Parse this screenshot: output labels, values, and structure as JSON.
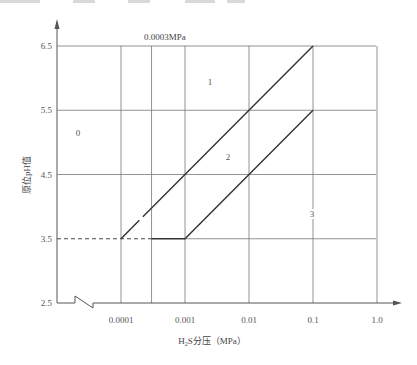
{
  "chart_data": {
    "type": "line",
    "title": "",
    "xlabel": "H2S分压（MPa）",
    "xlabel_parts": {
      "pre": "H",
      "sub": "2",
      "post": "S分压（MPa）"
    },
    "ylabel": "原位pH值",
    "x_scale": "log",
    "x_ticks": [
      "0.0001",
      "0.001",
      "0.01",
      "0.1",
      "1.0"
    ],
    "x_tick_values": [
      0.0001,
      0.001,
      0.01,
      0.1,
      1.0
    ],
    "y_ticks": [
      "2.5",
      "3.5",
      "4.5",
      "5.5",
      "6.5"
    ],
    "y_tick_values": [
      2.5,
      3.5,
      4.5,
      5.5,
      6.5
    ],
    "xlim": [
      1e-05,
      1.0
    ],
    "ylim": [
      2.5,
      6.5
    ],
    "grid": true,
    "axis_break_on_x": true,
    "extra_vertical_line": {
      "x": 0.0003,
      "label": "0.0003MPa"
    },
    "series": [
      {
        "name": "boundary 0-1/2 (upper)",
        "style": "solid",
        "points": [
          [
            0.0001,
            3.5
          ],
          [
            0.1,
            6.5
          ]
        ]
      },
      {
        "name": "boundary 2-3 (lower)",
        "style": "solid",
        "points": [
          [
            0.0003,
            3.5
          ],
          [
            0.001,
            3.5
          ],
          [
            0.1,
            5.5
          ]
        ]
      },
      {
        "name": "pH 3.5 reference",
        "style": "dashed",
        "points": [
          [
            1e-05,
            3.5
          ],
          [
            0.0003,
            3.5
          ]
        ]
      }
    ],
    "regions": [
      {
        "label": "0",
        "x": 3e-05,
        "y": 5.1
      },
      {
        "label": "1",
        "x": 0.003,
        "y": 5.9
      },
      {
        "label": "2",
        "x": 0.006,
        "y": 4.7
      },
      {
        "label": "3",
        "x": 0.1,
        "y": 3.9
      }
    ]
  }
}
